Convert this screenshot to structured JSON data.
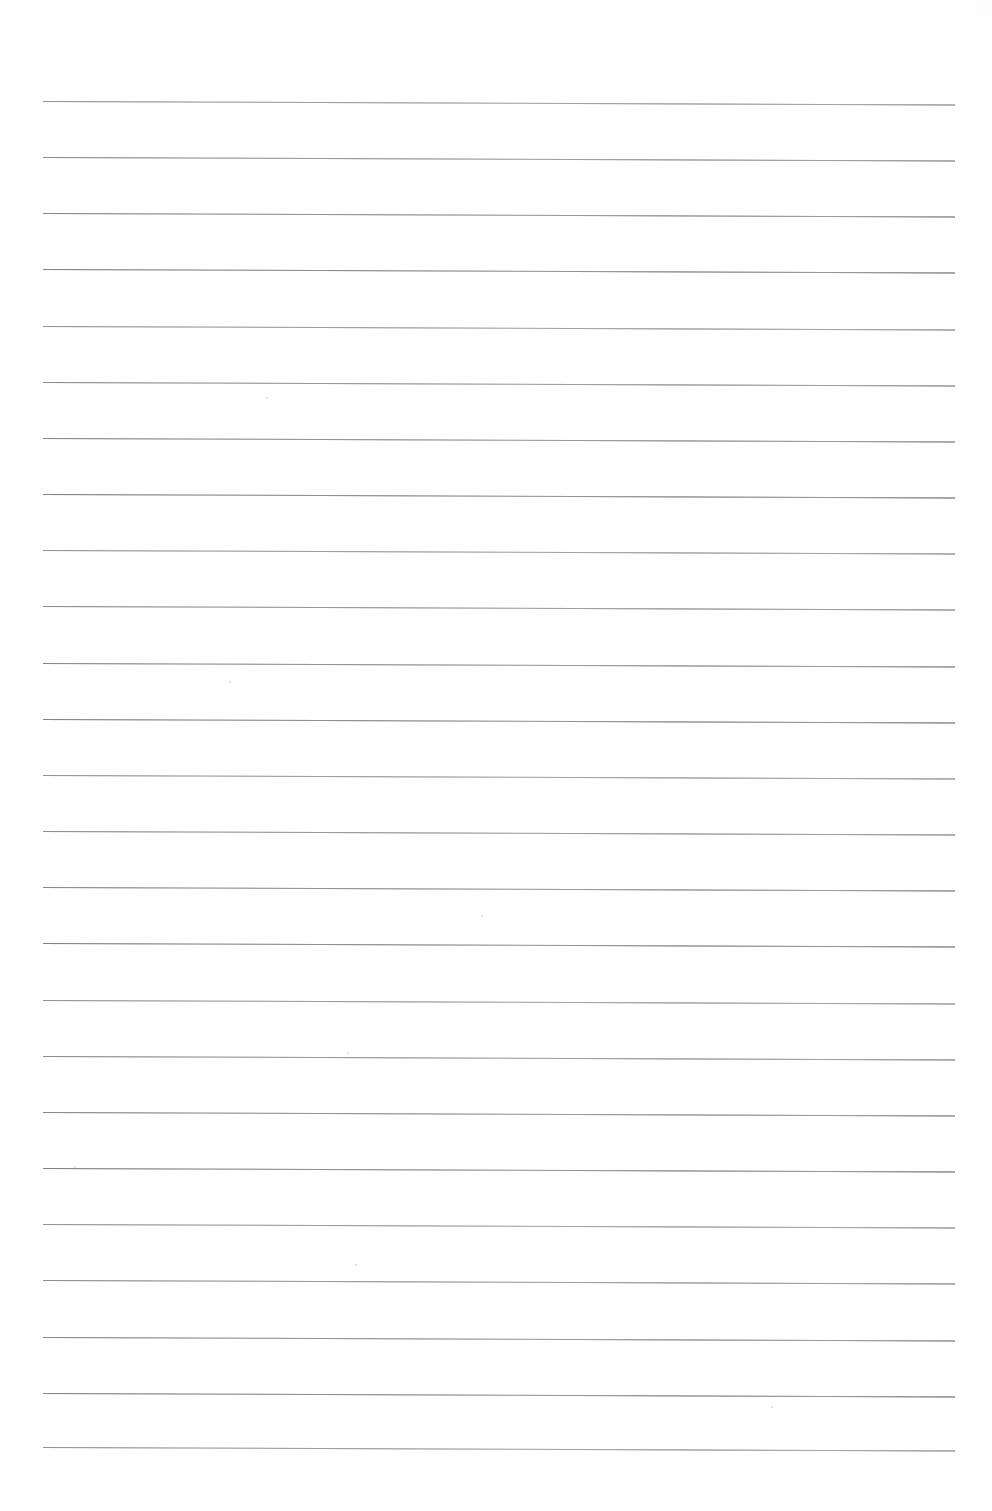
{
  "document": {
    "kind": "scanned-ruled-notebook-page",
    "page_width": 992,
    "page_height": 1511,
    "background_color": "#ffffff",
    "body_text": "",
    "has_text_content": false,
    "has_handwriting": false,
    "margins": {
      "left": 43,
      "right": 955,
      "top": 101,
      "bottom": 1447
    }
  },
  "ruling": {
    "line_color": "#8f8f93",
    "line_thickness_px": 1,
    "line_count": 25,
    "line_start_x": 43,
    "line_end_x": 955,
    "first_line_y": 101,
    "line_spacing_px": 56.1,
    "slope_deg": 0.22,
    "line_y_positions": [
      101,
      157,
      213,
      269,
      326,
      382,
      438,
      494,
      550,
      606,
      663,
      719,
      775,
      831,
      887,
      943,
      1000,
      1056,
      1112,
      1168,
      1224,
      1280,
      1337,
      1393,
      1447
    ]
  },
  "artifacts": {
    "specks": [
      {
        "x": 481,
        "y": 915,
        "size": 2
      },
      {
        "x": 347,
        "y": 1052,
        "size": 2
      },
      {
        "x": 74,
        "y": 1166,
        "size": 2
      },
      {
        "x": 355,
        "y": 1264,
        "size": 2
      },
      {
        "x": 771,
        "y": 1406,
        "size": 2
      },
      {
        "x": 229,
        "y": 681,
        "size": 2
      },
      {
        "x": 266,
        "y": 397,
        "size": 2
      }
    ]
  }
}
